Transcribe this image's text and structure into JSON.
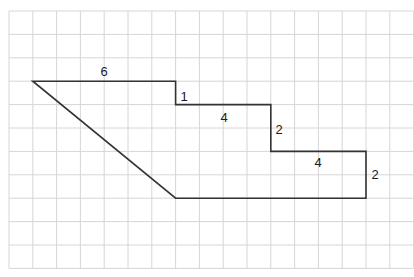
{
  "diagram": {
    "type": "composite-shape-on-grid",
    "grid": {
      "columns": 17,
      "rows": 11,
      "line_color": "#d6d6d6",
      "origin_px": [
        9,
        11
      ],
      "cell_px": [
        23.8,
        23.4
      ]
    },
    "shape": {
      "stroke_color": "#333333",
      "vertices_grid": [
        [
          1,
          3
        ],
        [
          7,
          3
        ],
        [
          7,
          4
        ],
        [
          11,
          4
        ],
        [
          11,
          6
        ],
        [
          15,
          6
        ],
        [
          15,
          8
        ],
        [
          7,
          8
        ]
      ],
      "description": "Polygon with a slanted left edge and stepped top-right edges"
    },
    "labels": [
      {
        "text": "6",
        "side": "top edge",
        "pos_px": [
          104,
          76
        ]
      },
      {
        "text": "1",
        "side": "first step vertical",
        "pos_px": [
          184,
          101
        ]
      },
      {
        "text": "4",
        "side": "second horizontal",
        "pos_px": [
          224,
          122
        ]
      },
      {
        "text": "2",
        "side": "second step vertical",
        "pos_px": [
          279,
          134
        ]
      },
      {
        "text": "4",
        "side": "third horizontal",
        "pos_px": [
          318,
          167
        ]
      },
      {
        "text": "2",
        "side": "right edge",
        "pos_px": [
          375,
          179
        ]
      }
    ]
  }
}
